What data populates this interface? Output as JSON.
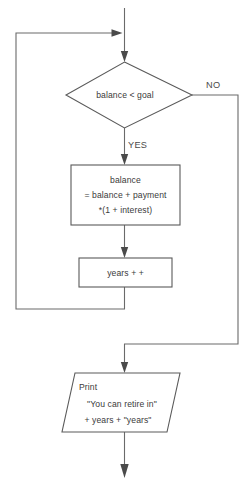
{
  "diagram": {
    "type": "flowchart",
    "colors": {
      "background": "#ffffff",
      "shape_stroke": "#5a5a5a",
      "connector_stroke": "#6a6a6a",
      "arrowhead": "#4a4a4a",
      "text": "#3a3a3a"
    }
  },
  "nodes": {
    "decision": {
      "shape": "diamond",
      "text": "balance < goal"
    },
    "process_balance": {
      "shape": "rectangle",
      "line1": "balance",
      "line2": "= balance + payment",
      "line3": "*(1 + interest)"
    },
    "process_years": {
      "shape": "rectangle",
      "text": "years + +"
    },
    "output_print": {
      "shape": "parallelogram",
      "line1": "Print",
      "line2": "\"You can retire in\"",
      "line3": "+ years + \"years\""
    }
  },
  "labels": {
    "yes": "YES",
    "no": "NO"
  },
  "connectors": {
    "entry": "entry-arrow-into-decision",
    "loop_back": "loop-back-from-years-to-entry",
    "yes_branch": "decision-yes-to-balance",
    "no_branch": "decision-no-to-print",
    "balance_to_years": "balance-to-years",
    "print_exit": "print-exit-arrow"
  }
}
